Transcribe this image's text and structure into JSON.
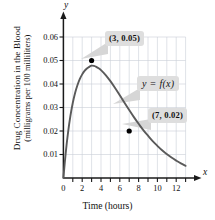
{
  "chart_data": {
    "type": "line",
    "title": "",
    "xlabel": "Time (hours)",
    "ylabel_line1": "Drug Concentration in the Blood",
    "ylabel_line2": "(milligrams per 100 milliliters)",
    "x_axis_letter": "x",
    "y_axis_letter": "y",
    "xlim": [
      0,
      13
    ],
    "ylim": [
      0,
      0.065
    ],
    "xticks": [
      0,
      2,
      4,
      6,
      8,
      10,
      12
    ],
    "xtick_labels": [
      "0",
      "2",
      "4",
      "6",
      "8",
      "10",
      "12"
    ],
    "xminorticks": [
      1,
      3,
      5,
      7,
      9,
      11,
      13
    ],
    "yticks": [
      0.01,
      0.02,
      0.03,
      0.04,
      0.05,
      0.06
    ],
    "ytick_labels": [
      "0.01",
      "0.02",
      "0.03",
      "0.04",
      "0.05",
      "0.06"
    ],
    "grid": true,
    "grid_x_step": 1,
    "grid_y_step": 0.01,
    "legend": "none",
    "series": [
      {
        "name": "y = f(x)",
        "curve_type": "surge",
        "description": "Drug concentration rises sharply to a peak then decays exponentially",
        "x": [
          0,
          0.25,
          0.5,
          0.75,
          1,
          1.25,
          1.5,
          1.75,
          2,
          2.25,
          2.5,
          2.75,
          3,
          3.25,
          3.5,
          3.75,
          4,
          4.5,
          5,
          5.5,
          6,
          6.5,
          7,
          7.5,
          8,
          8.5,
          9,
          9.5,
          10,
          10.5,
          11,
          11.5,
          12,
          12.5,
          13
        ],
        "y": [
          0,
          0.0108,
          0.0195,
          0.0265,
          0.032,
          0.0363,
          0.0396,
          0.0422,
          0.0441,
          0.0456,
          0.0466,
          0.0473,
          0.0478,
          0.0477,
          0.0473,
          0.0467,
          0.0459,
          0.0438,
          0.0412,
          0.0383,
          0.0352,
          0.032,
          0.0289,
          0.0259,
          0.0231,
          0.0204,
          0.018,
          0.0157,
          0.0137,
          0.0118,
          0.0102,
          0.0087,
          0.0074,
          0.0062,
          0.0052
        ]
      }
    ],
    "points": [
      {
        "label": "(3, 0.05)",
        "x": 3,
        "y": 0.05
      },
      {
        "label": "(7, 0.02)",
        "x": 7,
        "y": 0.02
      }
    ],
    "annotations": [
      {
        "name": "peak-point-callout",
        "text": "(3, 0.05)"
      },
      {
        "name": "function-callout",
        "text": "y = f(x)"
      },
      {
        "name": "decay-point-callout",
        "text": "(7, 0.02)"
      }
    ],
    "colors": {
      "curve": "#5a5a5a",
      "grid": "#c9cfd6",
      "axis": "#1a1a1a",
      "marker": "#000000",
      "callout_bg": "#dedede",
      "callout_text": "#111111"
    }
  }
}
